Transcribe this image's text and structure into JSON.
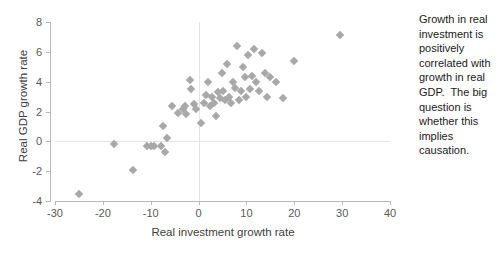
{
  "annotation": {
    "text": "Growth in real investment is positively correlated with growth in real GDP.  The big question is whether this implies causation."
  },
  "chart_data": {
    "type": "scatter",
    "title": "",
    "xlabel": "Real investment growth rate",
    "ylabel": "Real GDP growth rate",
    "xlim": [
      -30,
      40
    ],
    "ylim": [
      -4,
      8
    ],
    "xticks": [
      -30,
      -20,
      -10,
      0,
      10,
      20,
      30,
      40
    ],
    "yticks": [
      -4,
      -2,
      0,
      2,
      4,
      6,
      8
    ],
    "grid": "zero-lines-only",
    "legend": "none",
    "marker": "diamond",
    "marker_color": "#a8a8a8",
    "series": [
      {
        "name": "Real GDP vs Real investment growth",
        "points": [
          [
            -25.0,
            -3.5
          ],
          [
            -17.6,
            -0.2
          ],
          [
            -13.8,
            -1.9
          ],
          [
            -10.8,
            -0.3
          ],
          [
            -10.0,
            -0.3
          ],
          [
            -9.4,
            -0.3
          ],
          [
            -7.8,
            -0.3
          ],
          [
            -7.4,
            1.0
          ],
          [
            -7.0,
            -0.7
          ],
          [
            -6.6,
            0.2
          ],
          [
            -5.6,
            2.4
          ],
          [
            -4.4,
            1.9
          ],
          [
            -3.2,
            2.2
          ],
          [
            -2.8,
            2.4
          ],
          [
            -2.6,
            1.8
          ],
          [
            -1.8,
            4.1
          ],
          [
            -1.6,
            3.5
          ],
          [
            -1.0,
            2.5
          ],
          [
            -0.6,
            2.2
          ],
          [
            0.6,
            1.2
          ],
          [
            1.2,
            2.6
          ],
          [
            1.6,
            3.1
          ],
          [
            2.0,
            4.0
          ],
          [
            2.4,
            2.4
          ],
          [
            2.8,
            3.0
          ],
          [
            3.2,
            2.6
          ],
          [
            3.6,
            1.7
          ],
          [
            4.0,
            3.3
          ],
          [
            4.4,
            2.9
          ],
          [
            4.8,
            4.6
          ],
          [
            5.2,
            3.4
          ],
          [
            5.6,
            2.8
          ],
          [
            6.0,
            5.2
          ],
          [
            6.4,
            3.0
          ],
          [
            6.8,
            2.6
          ],
          [
            7.2,
            4.0
          ],
          [
            7.6,
            3.6
          ],
          [
            8.0,
            6.4
          ],
          [
            8.4,
            2.8
          ],
          [
            8.8,
            3.4
          ],
          [
            9.2,
            5.0
          ],
          [
            9.6,
            4.3
          ],
          [
            10.0,
            3.0
          ],
          [
            10.4,
            5.8
          ],
          [
            10.8,
            3.5
          ],
          [
            11.2,
            4.4
          ],
          [
            11.6,
            6.2
          ],
          [
            12.0,
            4.0
          ],
          [
            12.6,
            3.4
          ],
          [
            13.2,
            5.9
          ],
          [
            13.8,
            4.6
          ],
          [
            14.4,
            3.0
          ],
          [
            15.0,
            4.3
          ],
          [
            16.2,
            4.0
          ],
          [
            17.6,
            2.9
          ],
          [
            20.0,
            5.4
          ],
          [
            29.5,
            7.1
          ]
        ]
      }
    ]
  }
}
